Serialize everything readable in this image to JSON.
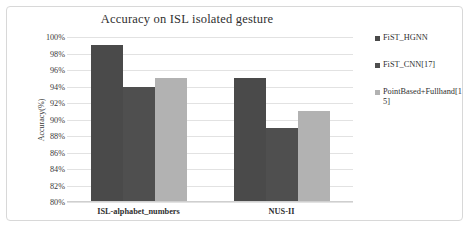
{
  "chart_data": {
    "type": "bar",
    "title": "Accuracy on ISL isolated gesture",
    "xlabel": "Dataset",
    "ylabel": "Accuracy(%)",
    "categories": [
      "ISL-alphabet_numbers",
      "NUS-II"
    ],
    "ylim": [
      80,
      100
    ],
    "ytick_step": 2,
    "ytick_labels": [
      "100%",
      "98%",
      "96%",
      "94%",
      "92%",
      "90%",
      "88%",
      "86%",
      "84%",
      "82%",
      "80%"
    ],
    "ytick_values": [
      100,
      98,
      96,
      94,
      92,
      90,
      88,
      86,
      84,
      82,
      80
    ],
    "grid": true,
    "legend_position": "right",
    "series": [
      {
        "name": "FiST_HGNN",
        "color": "#4a4a4a",
        "values": [
          99,
          95
        ]
      },
      {
        "name": "FiST_CNN[17]",
        "color": "#4f4f4f",
        "values": [
          94,
          89
        ]
      },
      {
        "name": "PointBased+Fullhand[15]",
        "color": "#b2b2b2",
        "values": [
          95,
          91
        ]
      }
    ]
  },
  "legend": {
    "items": [
      {
        "label": "FiST_HGNN",
        "color": "#4a4a4a"
      },
      {
        "label": "FiST_CNN[17]",
        "color": "#4f4f4f"
      },
      {
        "label": "PointBased+Fullhand[15]",
        "color": "#b2b2b2"
      }
    ]
  }
}
